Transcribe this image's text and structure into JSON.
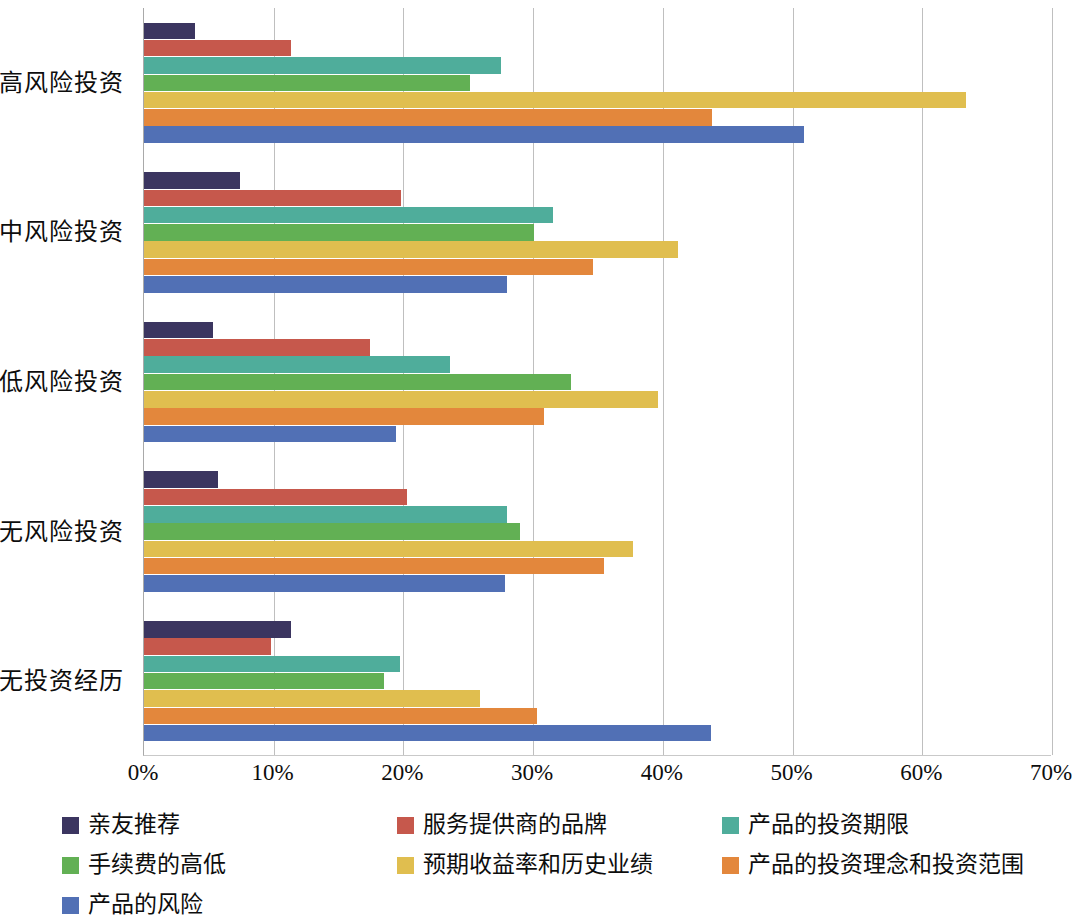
{
  "chart_data": {
    "type": "bar",
    "orientation": "horizontal",
    "title": "",
    "subtitle": "",
    "xlabel": "",
    "ylabel": "",
    "xlim": [
      0,
      70
    ],
    "xtick_labels": [
      "0%",
      "10%",
      "20%",
      "30%",
      "40%",
      "50%",
      "60%",
      "70%"
    ],
    "xtick_values": [
      0,
      10,
      20,
      30,
      40,
      50,
      60,
      70
    ],
    "xtick_suffix": "%",
    "grid": true,
    "grid_axis": "x",
    "legend_position": "bottom",
    "legend_columns": 3,
    "categories": [
      "高风险投资",
      "中风险投资",
      "低风险投资",
      "无风险投资",
      "无投资经历"
    ],
    "series": [
      {
        "name": "亲友推荐",
        "color": "#3B3560",
        "values": [
          3.9,
          7.4,
          5.3,
          5.7,
          11.3
        ]
      },
      {
        "name": "服务提供商的品牌",
        "color": "#C6584C",
        "values": [
          11.3,
          19.8,
          17.4,
          20.3,
          9.8
        ]
      },
      {
        "name": "产品的投资期限",
        "color": "#4FAD9B",
        "values": [
          27.5,
          31.5,
          23.6,
          28.0,
          19.7
        ]
      },
      {
        "name": "手续费的高低",
        "color": "#62B054",
        "values": [
          25.1,
          30.1,
          32.9,
          29.0,
          18.5
        ]
      },
      {
        "name": "预期收益率和历史业绩",
        "color": "#E0BE4F",
        "values": [
          63.4,
          41.2,
          39.6,
          37.7,
          25.9
        ]
      },
      {
        "name": "产品的投资理念和投资范围",
        "color": "#E3873C",
        "values": [
          43.8,
          34.6,
          30.8,
          35.5,
          30.3
        ]
      },
      {
        "name": "产品的风险",
        "color": "#5170B5",
        "values": [
          50.9,
          28.0,
          19.4,
          27.8,
          43.7
        ]
      }
    ]
  }
}
